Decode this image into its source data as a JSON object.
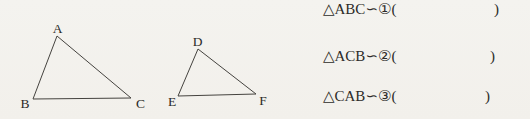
{
  "colors": {
    "background": "#f3f2ee",
    "ink": "#2c2b28",
    "line": "#45433f"
  },
  "figure": {
    "triangle_abc": {
      "points": "57,36 33,99 131,98",
      "labels": {
        "A": "A",
        "B": "B",
        "C": "C"
      }
    },
    "triangle_def": {
      "points": "198,49 178,96 256,94",
      "labels": {
        "D": "D",
        "E": "E",
        "F": "F"
      }
    }
  },
  "problems": [
    {
      "prefix": "△ABC∽①(",
      "close": ")"
    },
    {
      "prefix": "△ACB∽②(",
      "close": ")"
    },
    {
      "prefix": "△CAB∽③(",
      "close": ")"
    }
  ]
}
